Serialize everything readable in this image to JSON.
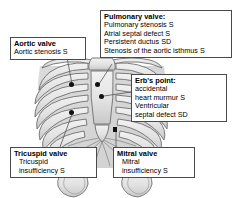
{
  "diagram": {
    "figure_name": "ribcage-thorax-illustration",
    "colors": {
      "marker": "#111111",
      "box_border": "#4a4a4a",
      "box_fill": "#ffffff",
      "bone_fill": "#e8e8e8",
      "bone_outline": "#6e6e6e",
      "background": "#ffffff",
      "leader_line": "#555555"
    }
  },
  "callouts": {
    "pulmonary": {
      "name": "pulmonary-valve-callout",
      "heading": "Pulmonary valve:",
      "lines": [
        "Pulmonary stenosis S",
        "Atrial septal defect S",
        "Persistent ductus SD",
        "Stenosis of the aortic isthmus S"
      ]
    },
    "aortic": {
      "name": "aortic-valve-callout",
      "heading": "Aortic valve",
      "lines": [
        "Aortic stenosis S"
      ]
    },
    "erb": {
      "name": "erbs-point-callout",
      "heading": "Erb's point:",
      "lines": [
        "accidental",
        "heart murmur S",
        "Ventricular",
        "septal defect SD"
      ]
    },
    "tricuspid": {
      "name": "tricuspid-valve-callout",
      "heading": "Tricuspid valve",
      "lines": [
        "Tricuspid",
        "insufficiency S"
      ]
    },
    "mitral": {
      "name": "mitral-valve-callout",
      "heading": "Mitral valve",
      "lines": [
        "Mitral",
        "insufficiency S"
      ]
    }
  },
  "markers": [
    {
      "id": "aortic-marker",
      "shape": "dot",
      "x": 71,
      "y": 84
    },
    {
      "id": "pulmonary-marker",
      "shape": "dot",
      "x": 97,
      "y": 84
    },
    {
      "id": "erb-marker",
      "shape": "dot",
      "x": 101,
      "y": 96
    },
    {
      "id": "tricuspid-marker",
      "shape": "dot",
      "x": 71,
      "y": 112
    },
    {
      "id": "mitral-marker",
      "shape": "square",
      "x": 114,
      "y": 129
    }
  ]
}
